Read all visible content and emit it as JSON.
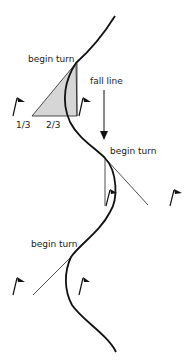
{
  "labels": {
    "begin_turn_1": "begin turn",
    "begin_turn_2": "begin turn",
    "begin_turn_3": "begin turn",
    "fall_line": "fall line",
    "one_third": "1/3",
    "two_thirds": "2/3"
  },
  "colors": {
    "line": "#111111",
    "triangle_fill": "#d4d4d4"
  }
}
